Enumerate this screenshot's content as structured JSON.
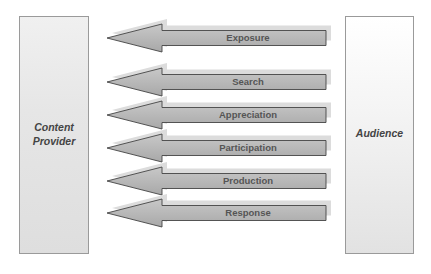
{
  "diagram": {
    "left_box": {
      "label_line1": "Content",
      "label_line2": "Provider"
    },
    "right_box": {
      "label": "Audience"
    },
    "arrows": [
      {
        "label": "Exposure",
        "y": 38
      },
      {
        "label": "Search",
        "y": 82
      },
      {
        "label": "Appreciation",
        "y": 115
      },
      {
        "label": "Participation",
        "y": 148
      },
      {
        "label": "Production",
        "y": 181
      },
      {
        "label": "Response",
        "y": 213
      }
    ],
    "direction": "Audience to Content Provider",
    "colors": {
      "arrow_fill": "#b4b4b4",
      "arrow_stroke": "#444444",
      "shadow": "#dcdcdc",
      "box_border": "#9a9a9a"
    }
  }
}
